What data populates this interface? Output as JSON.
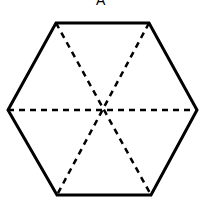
{
  "diagram": {
    "label": "A",
    "shape": "regular hexagon",
    "vertices": [
      [
        56,
        23
      ],
      [
        149,
        23
      ],
      [
        197,
        110
      ],
      [
        151,
        195
      ],
      [
        57,
        195
      ],
      [
        8,
        110
      ]
    ],
    "center": [
      104,
      110
    ],
    "diagonals": "dashed lines joining opposite vertices",
    "colors": {
      "stroke": "#000000",
      "background": "#ffffff"
    }
  }
}
